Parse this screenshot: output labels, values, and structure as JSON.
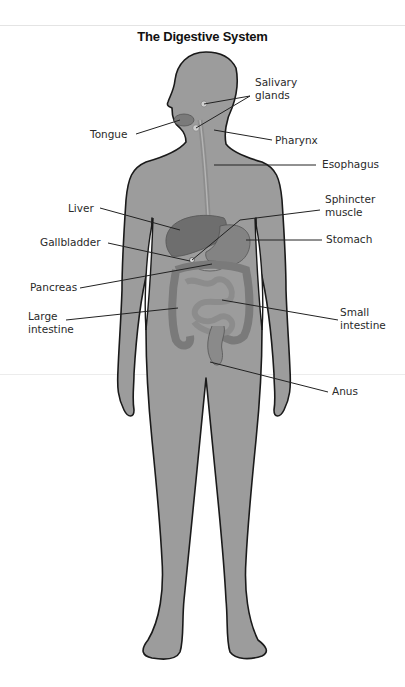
{
  "title": "The Digestive System",
  "colors": {
    "body_fill": "#9c9c9c",
    "outline": "#1a1a1a",
    "organ": "#7d7d7d",
    "background": "#ffffff"
  },
  "labels": {
    "salivary_glands": "Salivary\nglands",
    "tongue": "Tongue",
    "pharynx": "Pharynx",
    "esophagus": "Esophagus",
    "liver": "Liver",
    "sphincter_muscle": "Sphincter\nmuscle",
    "gallbladder": "Gallbladder",
    "stomach": "Stomach",
    "pancreas": "Pancreas",
    "large_intestine": "Large\nintestine",
    "small_intestine": "Small\nintestine",
    "anus": "Anus"
  }
}
